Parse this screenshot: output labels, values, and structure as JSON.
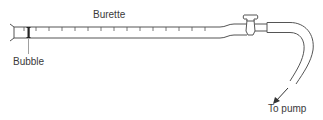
{
  "diagram": {
    "labels": {
      "burette": "Burette",
      "bubble": "Bubble",
      "to_pump": "To pump"
    },
    "colors": {
      "line": "#555555",
      "bubble": "#222222",
      "text": "#3a3a3a",
      "background": "#ffffff"
    },
    "components": [
      "burette-tube",
      "graduation-marks",
      "bubble",
      "stopcock",
      "tubing",
      "flow-arrow"
    ]
  }
}
